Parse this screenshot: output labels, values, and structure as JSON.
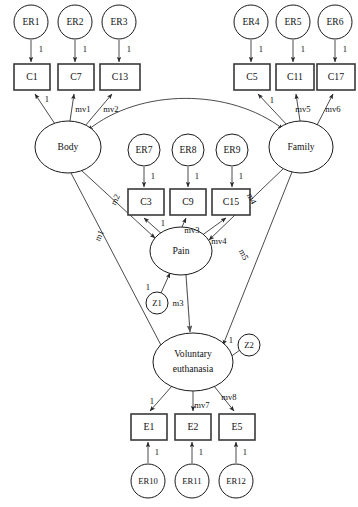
{
  "diagram": {
    "type": "structural-equation-model-path-diagram",
    "title": "",
    "latent_variables": [
      {
        "id": "body",
        "label": "Body",
        "cx": 68,
        "cy": 147,
        "rx": 33,
        "ry": 26
      },
      {
        "id": "family",
        "label": "Family",
        "cx": 301,
        "cy": 147,
        "rx": 32,
        "ry": 26
      },
      {
        "id": "pain",
        "label": "Pain",
        "cx": 181,
        "cy": 251,
        "rx": 31,
        "ry": 24
      },
      {
        "id": "ve",
        "label_line1": "Voluntary",
        "label_line2": "euthanasia",
        "cx": 193,
        "cy": 362,
        "rx": 40,
        "ry": 29
      }
    ],
    "error_terms": [
      {
        "id": "er1",
        "label": "ER1",
        "cx": 31,
        "cy": 22,
        "r": 17
      },
      {
        "id": "er2",
        "label": "ER2",
        "cx": 75,
        "cy": 22,
        "r": 17
      },
      {
        "id": "er3",
        "label": "ER3",
        "cx": 119,
        "cy": 22,
        "r": 17
      },
      {
        "id": "er4",
        "label": "ER4",
        "cx": 251,
        "cy": 22,
        "r": 17
      },
      {
        "id": "er5",
        "label": "ER5",
        "cx": 293,
        "cy": 22,
        "r": 17
      },
      {
        "id": "er6",
        "label": "ER6",
        "cx": 335,
        "cy": 22,
        "r": 17
      },
      {
        "id": "er7",
        "label": "ER7",
        "cx": 144,
        "cy": 150,
        "r": 16
      },
      {
        "id": "er8",
        "label": "ER8",
        "cx": 188,
        "cy": 150,
        "r": 16
      },
      {
        "id": "er9",
        "label": "ER9",
        "cx": 232,
        "cy": 150,
        "r": 16
      },
      {
        "id": "er10",
        "label": "ER10",
        "cx": 148,
        "cy": 481,
        "r": 17
      },
      {
        "id": "er11",
        "label": "ER11",
        "cx": 192,
        "cy": 481,
        "r": 17
      },
      {
        "id": "er12",
        "label": "ER12",
        "cx": 236,
        "cy": 481,
        "r": 17
      }
    ],
    "disturbances": [
      {
        "id": "z1",
        "label": "Z1",
        "cx": 157,
        "cy": 303,
        "r": 11
      },
      {
        "id": "z2",
        "label": "Z2",
        "cx": 249,
        "cy": 345,
        "r": 11
      }
    ],
    "indicators": [
      {
        "id": "c1",
        "label": "C1",
        "x": 14,
        "y": 64,
        "w": 36,
        "h": 26
      },
      {
        "id": "c7",
        "label": "C7",
        "x": 58,
        "y": 64,
        "w": 36,
        "h": 26
      },
      {
        "id": "c13",
        "label": "C13",
        "x": 100,
        "y": 64,
        "w": 40,
        "h": 26
      },
      {
        "id": "c5",
        "label": "C5",
        "x": 234,
        "y": 64,
        "w": 36,
        "h": 26
      },
      {
        "id": "c11",
        "label": "C11",
        "x": 276,
        "y": 64,
        "w": 38,
        "h": 26
      },
      {
        "id": "c17",
        "label": "C17",
        "x": 318,
        "y": 64,
        "w": 38,
        "h": 26
      },
      {
        "id": "c3",
        "label": "C3",
        "x": 128,
        "y": 189,
        "w": 36,
        "h": 26
      },
      {
        "id": "c9",
        "label": "C9",
        "x": 170,
        "y": 189,
        "w": 36,
        "h": 26
      },
      {
        "id": "c15",
        "label": "C15",
        "x": 212,
        "y": 189,
        "w": 38,
        "h": 26
      },
      {
        "id": "e1",
        "label": "E1",
        "x": 131,
        "y": 414,
        "w": 36,
        "h": 26
      },
      {
        "id": "e2",
        "label": "E2",
        "x": 175,
        "y": 414,
        "w": 36,
        "h": 26
      },
      {
        "id": "e5",
        "label": "E5",
        "x": 219,
        "y": 414,
        "w": 36,
        "h": 26
      }
    ],
    "path_labels": {
      "er1_c1": "1",
      "er2_c7": "1",
      "er3_c13": "1",
      "er4_c5": "1",
      "er5_c11": "1",
      "er6_c17": "1",
      "er7_c3": "1",
      "er8_c9": "1",
      "er9_c15": "1",
      "er10_e1": "1",
      "er11_e2": "1",
      "er12_e5": "1",
      "body_c1": "1",
      "body_c7": "mv1",
      "body_c13": "mv2",
      "family_c5": "1",
      "family_c11": "mv5",
      "family_c17": "mv6",
      "pain_c3": "1",
      "pain_c9": "mv3",
      "pain_c15": "mv4",
      "ve_e1": "1",
      "ve_e2": "mv7",
      "ve_e5": "mv8",
      "body_pain": "m2",
      "body_ve": "m1",
      "family_pain": "m4",
      "family_ve": "m5",
      "pain_ve": "m3",
      "z1_pain": "1",
      "z2_ve": "1"
    }
  }
}
